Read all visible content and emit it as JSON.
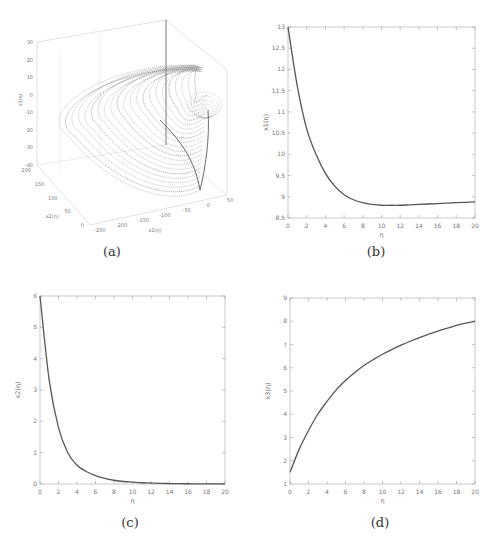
{
  "figure": {
    "captions": [
      "(a)",
      "(b)",
      "(c)",
      "(d)"
    ]
  },
  "chart_data": [
    {
      "id": "a",
      "type": "scatter",
      "title": "",
      "subtype": "3d-phase-portrait",
      "xlabel": "x1(η)",
      "ylabel": "x2(η)",
      "zlabel": "x3(η)",
      "x_ticks": [
        "-250",
        "-200",
        "-150",
        "-100",
        "-50",
        "0",
        "50"
      ],
      "y_ticks": [
        "0",
        "50",
        "100",
        "150",
        "200"
      ],
      "z_ticks": [
        "-40",
        "-30",
        "-20",
        "-10",
        "0",
        "10",
        "20",
        "30"
      ],
      "xlim": [
        -250,
        50
      ],
      "ylim": [
        0,
        200
      ],
      "zlim": [
        -40,
        30
      ],
      "grid": true,
      "description": "Dense family of nested parabolic-shaped trajectories converging toward a vertex near x1≈0, z between -10 and 15"
    },
    {
      "id": "b",
      "type": "line",
      "xlabel": "η",
      "ylabel": "x1(η)",
      "xlim": [
        0,
        20
      ],
      "ylim": [
        8.5,
        13
      ],
      "x_ticks": [
        "0",
        "2",
        "4",
        "6",
        "8",
        "10",
        "12",
        "14",
        "16",
        "18",
        "20"
      ],
      "y_ticks": [
        "8.5",
        "9",
        "9.5",
        "10",
        "10.5",
        "11",
        "11.5",
        "12",
        "12.5",
        "13"
      ],
      "x": [
        0,
        1,
        2,
        3,
        4,
        5,
        6,
        7,
        8,
        9,
        10,
        11,
        12,
        13,
        14,
        15,
        16,
        17,
        18,
        19,
        20
      ],
      "values": [
        13.0,
        11.6,
        10.6,
        10.0,
        9.55,
        9.25,
        9.05,
        8.93,
        8.86,
        8.82,
        8.8,
        8.8,
        8.8,
        8.81,
        8.82,
        8.83,
        8.84,
        8.85,
        8.86,
        8.87,
        8.88
      ]
    },
    {
      "id": "c",
      "type": "line",
      "xlabel": "η",
      "ylabel": "x2(η)",
      "xlim": [
        0,
        20
      ],
      "ylim": [
        0,
        6
      ],
      "x_ticks": [
        "0",
        "2",
        "4",
        "6",
        "8",
        "10",
        "12",
        "14",
        "16",
        "18",
        "20"
      ],
      "y_ticks": [
        "0",
        "1",
        "2",
        "3",
        "4",
        "5",
        "6"
      ],
      "x": [
        0,
        1,
        2,
        3,
        4,
        5,
        6,
        7,
        8,
        9,
        10,
        11,
        12,
        13,
        14,
        15,
        16,
        17,
        18,
        19,
        20
      ],
      "values": [
        6.0,
        3.3,
        1.8,
        1.0,
        0.6,
        0.4,
        0.27,
        0.18,
        0.12,
        0.08,
        0.06,
        0.04,
        0.03,
        0.02,
        0.015,
        0.01,
        0.008,
        0.006,
        0.004,
        0.003,
        0.002
      ]
    },
    {
      "id": "d",
      "type": "line",
      "xlabel": "η",
      "ylabel": "x3(η)",
      "xlim": [
        0,
        20
      ],
      "ylim": [
        1,
        9
      ],
      "x_ticks": [
        "0",
        "2",
        "4",
        "6",
        "8",
        "10",
        "12",
        "14",
        "16",
        "18",
        "20"
      ],
      "y_ticks": [
        "1",
        "2",
        "3",
        "4",
        "5",
        "6",
        "7",
        "8",
        "9"
      ],
      "x": [
        0,
        1,
        2,
        3,
        4,
        5,
        6,
        7,
        8,
        9,
        10,
        11,
        12,
        13,
        14,
        15,
        16,
        17,
        18,
        19,
        20
      ],
      "values": [
        1.5,
        2.5,
        3.3,
        4.0,
        4.55,
        5.05,
        5.45,
        5.8,
        6.1,
        6.35,
        6.58,
        6.78,
        6.97,
        7.14,
        7.3,
        7.45,
        7.58,
        7.7,
        7.82,
        7.92,
        8.0
      ]
    }
  ]
}
